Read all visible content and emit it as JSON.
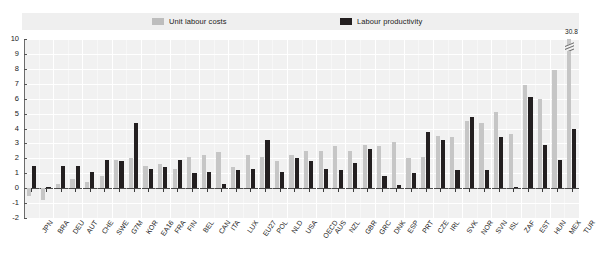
{
  "legend": {
    "items": [
      {
        "key": "unit-labour-costs",
        "label": "Unit labour costs",
        "color": "#bdbdbd"
      },
      {
        "key": "labour-productivity",
        "label": "Labour productivity",
        "color": "#231f20"
      }
    ]
  },
  "annotation": {
    "tur_value_label": "30.8"
  },
  "chart_data": {
    "type": "bar",
    "title": "",
    "xlabel": "",
    "ylabel": "",
    "ylim": [
      -2,
      10
    ],
    "yticks": [
      -2,
      -1,
      0,
      1,
      2,
      3,
      4,
      5,
      6,
      7,
      8,
      9,
      10
    ],
    "grid": true,
    "legend_position": "top",
    "categories": [
      "JPN",
      "BRA",
      "DEU",
      "AUT",
      "CHE",
      "SWE",
      "G7M",
      "KOR",
      "EA16",
      "FRA",
      "FIN",
      "BEL",
      "CAN",
      "ITA",
      "LUX",
      "EU27",
      "POL",
      "NLD",
      "USA",
      "OECD",
      "AUS",
      "NZL",
      "GBR",
      "GRC",
      "DNK",
      "ESP",
      "PRT",
      "CZE",
      "IRL",
      "SVK",
      "NOR",
      "SVN",
      "ISL",
      "ZAF",
      "EST",
      "HUN",
      "MEX",
      "TUR"
    ],
    "series": [
      {
        "name": "Unit labour costs",
        "color": "#c6c6c6",
        "values": [
          -0.5,
          -0.8,
          0.3,
          0.6,
          0.4,
          0.8,
          1.9,
          2.0,
          1.5,
          1.6,
          1.3,
          2.1,
          2.2,
          2.4,
          1.4,
          2.2,
          2.1,
          1.8,
          2.2,
          2.5,
          2.5,
          2.8,
          2.5,
          2.9,
          2.8,
          3.1,
          2.0,
          2.1,
          3.5,
          3.4,
          4.5,
          4.4,
          5.1,
          3.6,
          6.9,
          6.0,
          7.9,
          30.8
        ]
      },
      {
        "name": "Labour productivity",
        "color": "#231f20",
        "values": [
          1.5,
          0.1,
          1.5,
          1.5,
          1.1,
          1.9,
          1.8,
          4.4,
          1.3,
          1.4,
          1.9,
          1.0,
          1.1,
          0.3,
          1.2,
          1.3,
          3.2,
          1.1,
          2.0,
          1.8,
          1.3,
          1.2,
          1.7,
          2.6,
          0.8,
          0.2,
          1.0,
          3.8,
          3.2,
          1.2,
          4.8,
          1.2,
          3.4,
          0.1,
          6.1,
          2.9,
          1.9,
          4.0
        ]
      }
    ]
  }
}
